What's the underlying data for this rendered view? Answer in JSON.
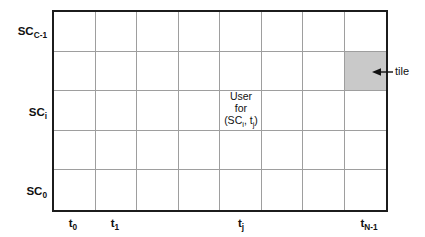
{
  "figure": {
    "background": "#ffffff",
    "text_color": "#111111",
    "grid": {
      "rows": 5,
      "cols": 8,
      "line_color": "#9e9e9e",
      "border_color": "#1c1c1c",
      "tile": {
        "row": 1,
        "col": 7,
        "fill": "#c9c9c9"
      }
    },
    "row_labels": [
      {
        "base": "SC",
        "sub": "C-1"
      },
      {
        "base": "SC",
        "sub": "i"
      },
      {
        "base": "SC",
        "sub": "0"
      }
    ],
    "col_labels": [
      {
        "base": "t",
        "sub": "0"
      },
      {
        "base": "t",
        "sub": "1"
      },
      {
        "base": "t",
        "sub": "j"
      },
      {
        "base": "t",
        "sub": "N-1"
      }
    ],
    "cell_annotation": {
      "line1": "User",
      "line2": "for",
      "line3": [
        {
          "text": "(SC"
        },
        {
          "sub": "i"
        },
        {
          "text": ", t"
        },
        {
          "sub": "j"
        },
        {
          "text": ")"
        }
      ]
    },
    "tile_annotation": {
      "label": "tile"
    }
  }
}
